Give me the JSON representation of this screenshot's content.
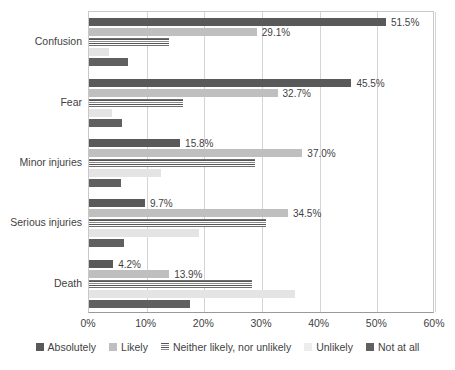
{
  "chart_data": {
    "type": "bar",
    "orientation": "horizontal",
    "title": "",
    "subtitle": "",
    "xlabel": "",
    "ylabel": "",
    "xlim": [
      0,
      60
    ],
    "xtick_labels": [
      "0%",
      "10%",
      "20%",
      "30%",
      "40%",
      "50%",
      "60%"
    ],
    "xtick_values": [
      0,
      10,
      20,
      30,
      40,
      50,
      60
    ],
    "grid": true,
    "legend_position": "bottom",
    "categories": [
      "Confusion",
      "Fear",
      "Minor injuries",
      "Serious injuries",
      "Death"
    ],
    "series": [
      {
        "name": "Absolutely",
        "color": "#595959",
        "values": [
          51.5,
          45.5,
          15.8,
          9.7,
          4.2
        ],
        "labels": [
          "51.5%",
          "45.5%",
          "15.8%",
          "9.7%",
          "4.2%"
        ],
        "labels_shown": true
      },
      {
        "name": "Likely",
        "color": "#bfbfbf",
        "values": [
          29.1,
          32.7,
          37.0,
          34.5,
          13.9
        ],
        "labels": [
          "29.1%",
          "32.7%",
          "37.0%",
          "34.5%",
          "13.9%"
        ],
        "labels_shown": true
      },
      {
        "name": "Neither likely, nor unlikely",
        "color": "#6e6e6e",
        "pattern": "horizontal-stripes",
        "values": [
          13.8,
          16.3,
          28.8,
          30.7,
          28.3
        ],
        "labels": [
          "",
          "",
          "",
          "",
          ""
        ],
        "labels_shown": false
      },
      {
        "name": "Unlikely",
        "color": "#e4e4e4",
        "values": [
          3.5,
          4.0,
          12.5,
          19.0,
          35.8
        ],
        "labels": [
          "",
          "",
          "",
          "",
          ""
        ],
        "labels_shown": false
      },
      {
        "name": "Not at all",
        "color": "#606060",
        "values": [
          6.8,
          5.8,
          5.5,
          6.0,
          17.5
        ],
        "labels": [
          "",
          "",
          "",
          "",
          ""
        ],
        "labels_shown": false
      }
    ]
  }
}
